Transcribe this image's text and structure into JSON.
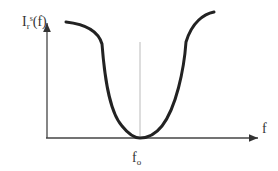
{
  "diagram": {
    "y_axis_label": {
      "main": "I",
      "sub": "r",
      "sup": "s",
      "arg": "(f)"
    },
    "x_axis_label": "f",
    "center_label": {
      "main": "f",
      "sub": "o"
    },
    "colors": {
      "curve": "#222222",
      "axis": "#444444",
      "center_line": "#aaaaaa"
    }
  }
}
